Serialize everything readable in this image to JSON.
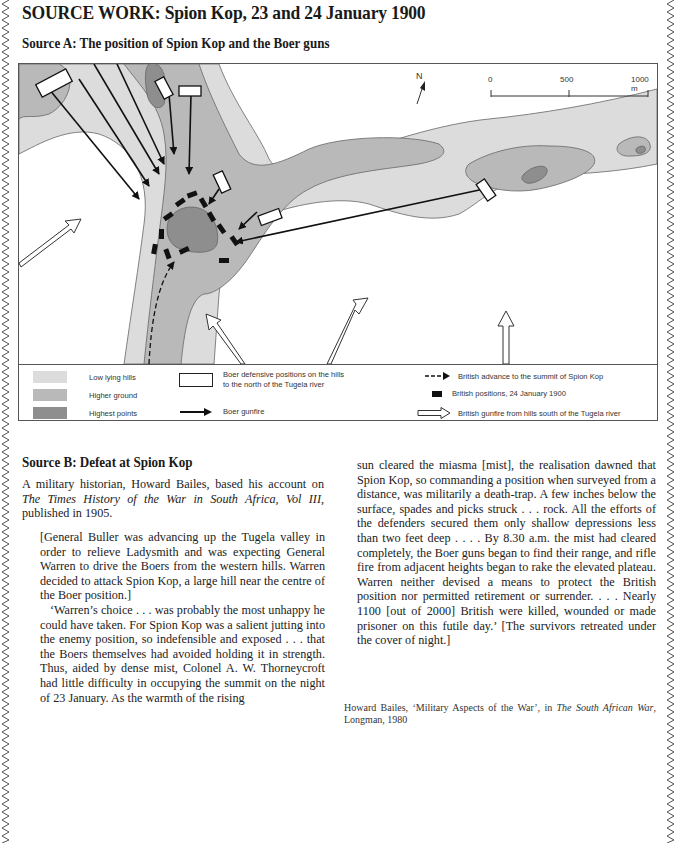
{
  "page": {
    "title": "SOURCE WORK:  Spion Kop, 23 and 24 January 1900"
  },
  "source_a": {
    "title": "Source A: The position of Spion Kop and the Boer guns",
    "map": {
      "north_label": "N",
      "scale": {
        "ticks": [
          "0",
          "500",
          "1000 m"
        ]
      },
      "colors": {
        "low_lying_hills": "#dcdcdc",
        "higher_ground": "#b9b9b9",
        "highest_points": "#8e8e8e",
        "background": "#ffffff",
        "outline": "#666666"
      },
      "legend": {
        "low_lying_hills": "Low lying hills",
        "higher_ground": "Higher ground",
        "highest_points": "Highest points",
        "boer_positions_line1": "Boer defensive positions on the hills",
        "boer_positions_line2": "to the north of the Tugela river",
        "boer_gunfire": "Boer gunfire",
        "british_advance": "British advance to the summit of Spion Kop",
        "british_positions": "British positions, 24 January 1900",
        "british_gunfire": "British gunfire from hills south of the Tugela river"
      }
    }
  },
  "source_b": {
    "title": "Source B:  Defeat at Spion Kop",
    "intro_1": "A military historian, Howard Bailes, based his account on ",
    "intro_italic": "The Times History of the War in South Africa, Vol III",
    "intro_2": ", published in 1905.",
    "quote_para1": "[General Buller was advancing up the Tugela valley in order to relieve Ladysmith and was expecting General Warren to drive the Boers from the western hills. Warren decided to attack Spion Kop, a large hill near the centre of the Boer position.]",
    "quote_para2": "‘Warren’s choice . . . was probably the most unhappy he could have taken. For Spion Kop was a salient jutting into the enemy position, so indefensible and exposed . . . that the Boers themselves had avoided holding it in strength. Thus, aided by dense mist, Colonel A. W. Thorneycroft had little difficulty in occupying the summit on the night of 23 January. As the warmth of the rising",
    "quote_para3": "sun cleared the miasma [mist], the realisation dawned that Spion Kop, so commanding a position when surveyed from a distance, was militarily a death-trap. A few inches below the surface, spades and picks struck . . . rock. All the efforts of the defenders secured them only shallow depressions less than two feet deep . . . . By 8.30 a.m. the mist had cleared completely, the Boer guns began to find their range, and rifle fire from adjacent heights began to rake the elevated plateau. Warren neither devised a means to protect the British position nor permitted retirement or surrender. . . . Nearly 1100 [out of 2000] British were killed, wounded or made prisoner on this futile day.’ [The survivors retreated under the cover of night.]",
    "citation_1": "Howard Bailes, ‘Military Aspects of the War’, in ",
    "citation_italic": "The South African War",
    "citation_2": ", Longman, 1980"
  }
}
